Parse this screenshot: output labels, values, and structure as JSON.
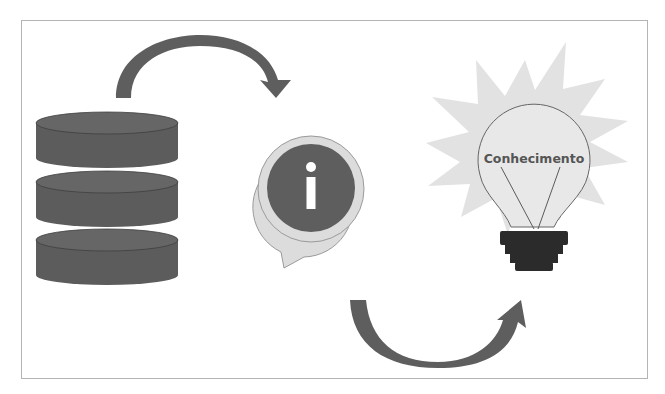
{
  "diagram": {
    "title": "",
    "nodes": [
      {
        "id": "database",
        "icon": "database-icon",
        "label": ""
      },
      {
        "id": "information",
        "icon": "info-speech-bubble-icon",
        "label": "i"
      },
      {
        "id": "knowledge",
        "icon": "lightbulb-icon",
        "label": "Conhecimento"
      }
    ],
    "edges": [
      {
        "from": "database",
        "to": "information",
        "style": "curved-arrow-over"
      },
      {
        "from": "information",
        "to": "knowledge",
        "style": "curved-arrow-under"
      }
    ],
    "bulb_label": "Conhecimento",
    "colors": {
      "dark": "#5a5a5a",
      "mid": "#6e6e6e",
      "light": "#d9d9d9",
      "bulb_fill": "#e6e6e6",
      "socket": "#2b2b2b",
      "frame": "#b4b4b4"
    }
  }
}
